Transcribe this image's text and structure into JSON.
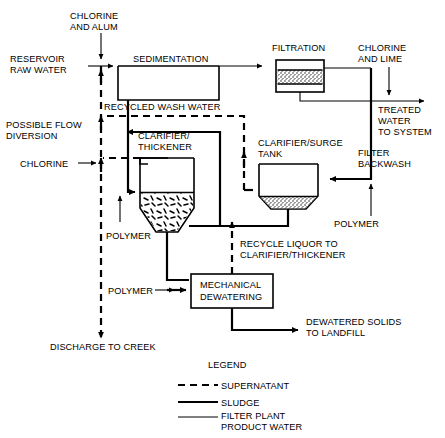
{
  "labels": {
    "chlorine_and_alum": [
      "CHLORINE",
      "AND ALUM"
    ],
    "reservoir_raw_water": [
      "RESERVOIR",
      "RAW WATER"
    ],
    "sedimentation": "SEDIMENTATION",
    "filtration": "FILTRATION",
    "chlorine_and_lime": [
      "CHLORINE",
      "AND LIME"
    ],
    "treated_water_to_system": [
      "TREATED",
      "WATER",
      "TO SYSTEM"
    ],
    "recycled_wash_water": "RECYCLED WASH WATER",
    "possible_flow_diversion": [
      "POSSIBLE FLOW",
      "DIVERSION"
    ],
    "chlorine": "CHLORINE",
    "clarifier_thickener": [
      "CLARIFIER/",
      "THICKENER"
    ],
    "clarifier_surge_tank": [
      "CLARIFIER/SURGE",
      "TANK"
    ],
    "filter_backwash": [
      "FILTER",
      "BACKWASH"
    ],
    "polymer_clarifier": "POLYMER",
    "polymer_surge": "POLYMER",
    "polymer_dewatering": "POLYMER",
    "recycle_liquor": [
      "RECYCLE LIQUOR TO",
      "CLARIFIER/THICKENER"
    ],
    "mechanical_dewatering": [
      "MECHANICAL",
      "DEWATERING"
    ],
    "dewatered_solids": [
      "DEWATERED SOLIDS",
      "TO LANDFILL"
    ],
    "discharge_to_creek": "DISCHARGE TO CREEK"
  },
  "legend": {
    "title": "LEGEND",
    "entries": [
      {
        "style": "dashed-thick",
        "label": "SUPERNATANT"
      },
      {
        "style": "solid-thick",
        "label": "SLUDGE"
      },
      {
        "style": "solid-thin",
        "label": [
          "FILTER PLANT",
          "PRODUCT WATER"
        ]
      }
    ]
  },
  "colors": {
    "line": "#000000",
    "background": "#ffffff",
    "media": "#d8d8d8"
  }
}
